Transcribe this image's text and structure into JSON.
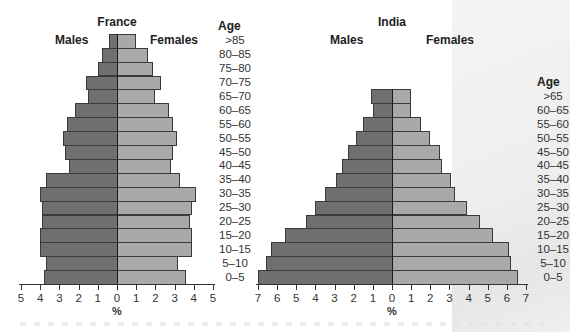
{
  "chart_data": [
    {
      "type": "bar",
      "subtype": "population-pyramid",
      "title": "France",
      "left_label": "Males",
      "right_label": "Females",
      "age_header": "Age",
      "xlabel": "%",
      "xlim": [
        -5,
        5
      ],
      "x_ticks": [
        "5",
        "4",
        "3",
        "2",
        "1",
        "0",
        "1",
        "2",
        "3",
        "4",
        "5"
      ],
      "categories": [
        ">85",
        "80–85",
        "75–80",
        "70–75",
        "65–70",
        "60–65",
        "55–60",
        "50–55",
        "45–50",
        "40–45",
        "35–40",
        "30–35",
        "25–30",
        "20–25",
        "15–20",
        "10–15",
        "5–10",
        "0–5"
      ],
      "series": [
        {
          "name": "Males",
          "color": "#6f6f6f",
          "values": [
            0.4,
            0.8,
            1.0,
            1.6,
            1.5,
            2.2,
            2.6,
            2.8,
            2.7,
            2.5,
            3.7,
            4.0,
            3.9,
            3.9,
            4.0,
            4.0,
            3.7,
            3.8
          ]
        },
        {
          "name": "Females",
          "color": "#a9a9a9",
          "values": [
            1.0,
            1.6,
            1.9,
            2.3,
            2.0,
            2.7,
            2.9,
            3.1,
            2.9,
            2.8,
            3.3,
            4.1,
            3.9,
            3.8,
            3.9,
            3.9,
            3.2,
            3.6
          ]
        }
      ]
    },
    {
      "type": "bar",
      "subtype": "population-pyramid",
      "title": "India",
      "left_label": "Males",
      "right_label": "Females",
      "age_header": "Age",
      "xlabel": "%",
      "xlim": [
        -7,
        7
      ],
      "x_ticks": [
        "7",
        "6",
        "5",
        "4",
        "3",
        "2",
        "1",
        "0",
        "1",
        "2",
        "3",
        "4",
        "5",
        "6",
        "7"
      ],
      "categories": [
        ">65",
        "60–65",
        "55–60",
        "50–55",
        "45–50",
        "40–45",
        "35–40",
        "30–35",
        "25–30",
        "20–25",
        "15–20",
        "10–15",
        "5–10",
        "0–5"
      ],
      "series": [
        {
          "name": "Males",
          "color": "#6f6f6f",
          "values": [
            1.1,
            1.0,
            1.5,
            1.9,
            2.3,
            2.6,
            2.9,
            3.5,
            4.0,
            4.5,
            5.6,
            6.3,
            6.6,
            7.0
          ]
        },
        {
          "name": "Females",
          "color": "#a9a9a9",
          "values": [
            1.0,
            1.0,
            1.5,
            2.0,
            2.5,
            2.6,
            3.1,
            3.3,
            3.9,
            4.6,
            5.3,
            6.1,
            6.2,
            6.6
          ]
        }
      ]
    }
  ]
}
